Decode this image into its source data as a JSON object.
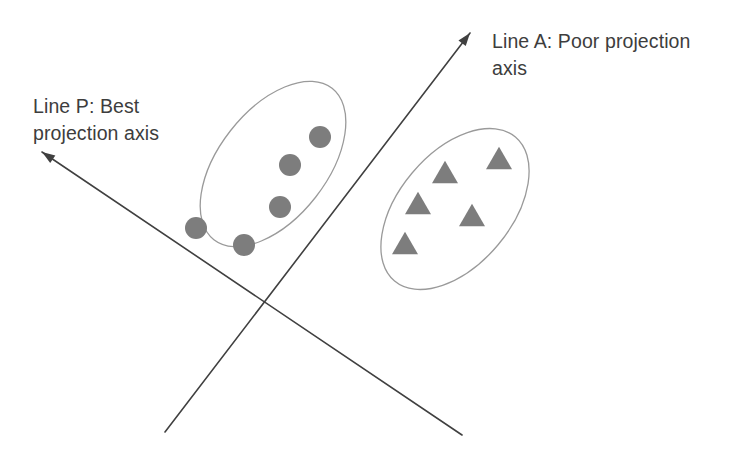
{
  "figure": {
    "width": 745,
    "height": 460,
    "background_color": "#ffffff"
  },
  "labels": {
    "line_p": "Line P: Best\nprojection axis",
    "line_a": "Line A: Poor projection\naxis",
    "text_color": "#3d3d3d"
  },
  "chart_data": {
    "type": "scatter",
    "xlabel": "",
    "ylabel": "",
    "xlim": [
      0,
      745
    ],
    "ylim": [
      0,
      460
    ],
    "grid": false,
    "legend": "none",
    "annotations": [
      {
        "name": "line-p-label",
        "text": "Line P: Best\nprojection axis",
        "x": 33,
        "y": 93
      },
      {
        "name": "line-a-label",
        "text": "Line A: Poor projection\naxis",
        "x": 492,
        "y": 28
      }
    ],
    "axes_lines": [
      {
        "name": "line-p",
        "label": "Line P: Best projection axis",
        "arrow_at": "start",
        "x1": 42,
        "y1": 152,
        "x2": 462,
        "y2": 435,
        "color": "#404040",
        "width": 1.6
      },
      {
        "name": "line-a",
        "label": "Line A: Poor projection axis",
        "arrow_at": "end",
        "x1": 165,
        "y1": 432,
        "x2": 470,
        "y2": 33,
        "color": "#404040",
        "width": 1.6
      }
    ],
    "intersection": {
      "x": 266,
      "y": 300
    },
    "series": [
      {
        "name": "Class 1 (circles)",
        "marker": "circle",
        "color": "#7d7d7d",
        "marker_size": 22,
        "count": 5,
        "points": [
          {
            "x": 320,
            "y": 137
          },
          {
            "x": 290,
            "y": 165
          },
          {
            "x": 280,
            "y": 207
          },
          {
            "x": 196,
            "y": 228
          },
          {
            "x": 244,
            "y": 245
          }
        ],
        "hull": {
          "name": "circle-cluster-ellipse",
          "cx": 273,
          "cy": 164,
          "rx": 96,
          "ry": 54,
          "rotation_deg": -52,
          "stroke": "#9a9a9a",
          "stroke_width": 1.3
        }
      },
      {
        "name": "Class 2 (triangles)",
        "marker": "triangle",
        "color": "#7d7d7d",
        "marker_size": 26,
        "count": 5,
        "points": [
          {
            "x": 499,
            "y": 158
          },
          {
            "x": 445,
            "y": 172
          },
          {
            "x": 418,
            "y": 203
          },
          {
            "x": 472,
            "y": 215
          },
          {
            "x": 405,
            "y": 243
          }
        ],
        "hull": {
          "name": "triangle-cluster-ellipse",
          "cx": 455,
          "cy": 209,
          "rx": 94,
          "ry": 56,
          "rotation_deg": -50,
          "stroke": "#9a9a9a",
          "stroke_width": 1.3
        }
      }
    ]
  }
}
